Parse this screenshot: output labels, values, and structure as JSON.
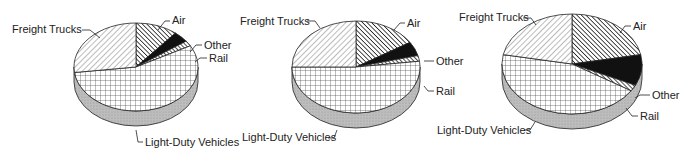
{
  "chart_data": [
    {
      "type": "pie",
      "title": "",
      "style": "3d-pie",
      "slices": [
        {
          "label": "Air",
          "value": 11,
          "pattern": "dense-diagonal"
        },
        {
          "label": "Other",
          "value": 4,
          "pattern": "solid-black"
        },
        {
          "label": "Rail",
          "value": 2,
          "pattern": "hatched-stripe"
        },
        {
          "label": "Light-Duty Vehicles",
          "value": 56,
          "pattern": "grid"
        },
        {
          "label": "Freight Trucks",
          "value": 27,
          "pattern": "light-diagonal"
        }
      ]
    },
    {
      "type": "pie",
      "title": "",
      "style": "3d-pie",
      "slices": [
        {
          "label": "Air",
          "value": 16,
          "pattern": "dense-diagonal"
        },
        {
          "label": "Other",
          "value": 5,
          "pattern": "solid-black"
        },
        {
          "label": "Rail",
          "value": 2,
          "pattern": "hatched-stripe"
        },
        {
          "label": "Light-Duty Vehicles",
          "value": 52,
          "pattern": "grid"
        },
        {
          "label": "Freight Trucks",
          "value": 25,
          "pattern": "light-diagonal"
        }
      ]
    },
    {
      "type": "pie",
      "title": "",
      "style": "3d-pie",
      "slices": [
        {
          "label": "Air",
          "value": 22,
          "pattern": "dense-diagonal"
        },
        {
          "label": "Other",
          "value": 10,
          "pattern": "solid-black"
        },
        {
          "label": "Rail",
          "value": 2,
          "pattern": "hatched-stripe"
        },
        {
          "label": "Light-Duty Vehicles",
          "value": 44,
          "pattern": "grid"
        },
        {
          "label": "Freight Trucks",
          "value": 22,
          "pattern": "light-diagonal"
        }
      ]
    }
  ],
  "labels": {
    "air": "Air",
    "other": "Other",
    "rail": "Rail",
    "light_duty": "Light-Duty Vehicles",
    "freight": "Freight Trucks"
  },
  "colors": {
    "ink": "#1a1a1a",
    "side": "#bdbdbd",
    "background": "#ffffff"
  }
}
